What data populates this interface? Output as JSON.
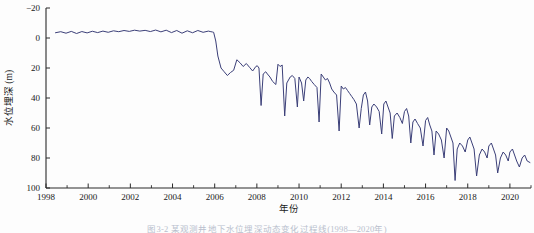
{
  "figure": {
    "background_color": "#fdfdfd",
    "caption": "图3-2  某观测井地下水位埋深动态变化过程线(1998—2020年)"
  },
  "chart_data": {
    "type": "line",
    "title": "",
    "xlabel": "年份",
    "ylabel": "水位埋深 (m)",
    "xlim": [
      1998,
      2021
    ],
    "ylim": [
      -20,
      100
    ],
    "y_inverted": true,
    "grid": false,
    "legend": null,
    "line_color": "#3b3f78",
    "line_width": 1.0,
    "x_ticks": [
      1998,
      2000,
      2002,
      2004,
      2006,
      2008,
      2010,
      2012,
      2014,
      2016,
      2018,
      2020
    ],
    "x_tick_labels": [
      "1998",
      "2000",
      "2002",
      "2004",
      "2006",
      "2008",
      "2010",
      "2012",
      "2014",
      "2016",
      "2018",
      "2020"
    ],
    "x_minor_ticks": [
      1999,
      2001,
      2003,
      2005,
      2007,
      2009,
      2011,
      2013,
      2015,
      2017,
      2019,
      2021
    ],
    "y_ticks": [
      -20,
      0,
      20,
      40,
      60,
      80,
      100
    ],
    "y_tick_labels": [
      "−20",
      "0",
      "20",
      "40",
      "60",
      "80",
      "100"
    ],
    "series": [
      {
        "name": "水位埋深",
        "units": "m",
        "x": [
          1998.45,
          1998.7,
          1998.95,
          1999.2,
          1999.45,
          1999.7,
          1999.95,
          2000.2,
          2000.45,
          2000.7,
          2000.95,
          2001.2,
          2001.45,
          2001.7,
          2001.95,
          2002.2,
          2002.45,
          2002.7,
          2002.95,
          2003.2,
          2003.45,
          2003.7,
          2003.95,
          2004.2,
          2004.45,
          2004.7,
          2004.95,
          2005.2,
          2005.45,
          2005.7,
          2005.82,
          2005.9,
          2005.95,
          2006.05,
          2006.15,
          2006.3,
          2006.45,
          2006.6,
          2006.75,
          2006.9,
          2007.05,
          2007.2,
          2007.35,
          2007.5,
          2007.65,
          2007.8,
          2007.95,
          2008.02,
          2008.1,
          2008.2,
          2008.3,
          2008.42,
          2008.5,
          2008.62,
          2008.75,
          2008.9,
          2009.0,
          2009.1,
          2009.2,
          2009.32,
          2009.42,
          2009.5,
          2009.58,
          2009.68,
          2009.8,
          2009.92,
          2010.0,
          2010.12,
          2010.22,
          2010.32,
          2010.42,
          2010.5,
          2010.6,
          2010.72,
          2010.85,
          2010.95,
          2011.05,
          2011.15,
          2011.25,
          2011.35,
          2011.45,
          2011.55,
          2011.65,
          2011.78,
          2011.9,
          2012.0,
          2012.1,
          2012.2,
          2012.3,
          2012.4,
          2012.5,
          2012.6,
          2012.72,
          2012.85,
          2012.95,
          2013.05,
          2013.15,
          2013.25,
          2013.35,
          2013.45,
          2013.55,
          2013.68,
          2013.8,
          2013.92,
          2014.02,
          2014.12,
          2014.22,
          2014.32,
          2014.42,
          2014.52,
          2014.65,
          2014.78,
          2014.9,
          2015.0,
          2015.1,
          2015.2,
          2015.3,
          2015.4,
          2015.5,
          2015.62,
          2015.75,
          2015.88,
          2016.0,
          2016.1,
          2016.2,
          2016.3,
          2016.4,
          2016.5,
          2016.62,
          2016.75,
          2016.88,
          2017.0,
          2017.1,
          2017.2,
          2017.3,
          2017.4,
          2017.5,
          2017.62,
          2017.75,
          2017.88,
          2018.0,
          2018.1,
          2018.2,
          2018.3,
          2018.42,
          2018.55,
          2018.68,
          2018.8,
          2018.92,
          2019.0,
          2019.12,
          2019.22,
          2019.32,
          2019.42,
          2019.55,
          2019.68,
          2019.8,
          2019.92,
          2020.0,
          2020.12,
          2020.22,
          2020.32,
          2020.45,
          2020.58,
          2020.7,
          2020.82,
          2020.95
        ],
        "y": [
          -3.5,
          -4.2,
          -3.2,
          -4.4,
          -3.0,
          -4.3,
          -3.4,
          -4.5,
          -3.6,
          -4.6,
          -3.8,
          -4.8,
          -4.2,
          -5.0,
          -4.4,
          -5.2,
          -4.6,
          -5.1,
          -4.3,
          -5.3,
          -4.1,
          -5.2,
          -3.6,
          -5.0,
          -3.2,
          -4.8,
          -3.5,
          -5.0,
          -3.8,
          -4.6,
          -4.2,
          -4.0,
          -3.8,
          2.0,
          12.0,
          20.0,
          22.5,
          25.0,
          23.0,
          21.5,
          14.5,
          16.5,
          19.0,
          17.0,
          19.5,
          22.0,
          19.0,
          18.5,
          20.0,
          45.0,
          24.0,
          22.5,
          24.0,
          26.0,
          29.0,
          31.0,
          17.5,
          19.0,
          18.0,
          52.0,
          30.0,
          28.0,
          26.0,
          25.0,
          27.0,
          46.0,
          26.0,
          30.0,
          42.0,
          28.0,
          26.0,
          27.0,
          29.0,
          31.0,
          33.0,
          56.0,
          24.0,
          26.0,
          28.0,
          27.0,
          30.0,
          34.0,
          36.0,
          38.0,
          62.0,
          32.0,
          34.0,
          33.0,
          35.0,
          37.0,
          39.0,
          41.0,
          44.0,
          60.0,
          47.0,
          38.0,
          36.0,
          42.0,
          58.0,
          46.0,
          44.0,
          46.0,
          49.0,
          64.0,
          44.0,
          42.0,
          46.0,
          50.0,
          67.0,
          52.0,
          50.0,
          53.0,
          57.0,
          49.0,
          47.0,
          52.0,
          70.0,
          56.0,
          54.0,
          57.0,
          60.0,
          72.0,
          55.0,
          53.0,
          58.0,
          62.0,
          78.0,
          62.0,
          64.0,
          68.0,
          80.0,
          60.0,
          62.0,
          66.0,
          70.0,
          95.0,
          74.0,
          70.0,
          72.0,
          76.0,
          68.0,
          66.0,
          70.0,
          74.0,
          92.0,
          78.0,
          74.0,
          76.0,
          80.0,
          72.0,
          70.0,
          74.0,
          78.0,
          90.0,
          80.0,
          76.0,
          78.0,
          82.0,
          76.0,
          74.0,
          78.0,
          82.0,
          86.0,
          80.0,
          78.0,
          82.0,
          83.0
        ]
      }
    ],
    "annotations": {
      "regime_shift_year": 2006,
      "pre_shift_mean_depth": -4.2,
      "end_depth": 83,
      "max_depth": 95
    }
  }
}
